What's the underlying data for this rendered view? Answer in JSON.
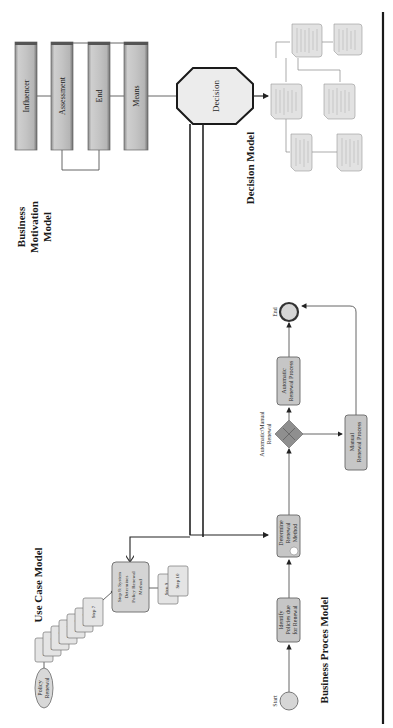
{
  "figure": {
    "orientation": "rotated 90° counterclockwise",
    "sections": {
      "business_motivation_model": {
        "title_lines": [
          "Business",
          "Motivation",
          "Model"
        ],
        "elements": [
          "Influencer",
          "Assessment",
          "End",
          "Means"
        ]
      },
      "decision": {
        "label": "Decision"
      },
      "decision_model": {
        "title": "Decision Model",
        "node_count": 7
      },
      "business_process_model": {
        "title": "Business Proces Model",
        "start_label": "Start",
        "end_label": "End",
        "tasks": [
          {
            "id": "identify",
            "lines": [
              "Identify",
              "Policies due",
              "for Renewal"
            ]
          },
          {
            "id": "determine",
            "lines": [
              "Determine",
              "Renewal",
              "Method"
            ]
          },
          {
            "id": "automatic",
            "lines": [
              "Automatic",
              "Renewal Process"
            ]
          },
          {
            "id": "manual",
            "lines": [
              "Manual",
              "Renewal Process"
            ]
          }
        ],
        "gateway_label_lines": [
          "Automatic/Manual",
          "Renewal"
        ]
      },
      "use_case_model": {
        "title": "Use Case Model",
        "actor_lines": [
          "Policy",
          "Renewal"
        ],
        "steps": [
          "Step 1",
          "Step 2",
          "Step 3",
          "Step 4",
          "Step 5",
          "Step 6",
          "Step 7"
        ],
        "step8_lines": [
          "Step 8: System",
          "Determines",
          "Policy Renewal",
          "Method"
        ],
        "later_steps": [
          "Step 9",
          "Step 10"
        ]
      }
    }
  }
}
